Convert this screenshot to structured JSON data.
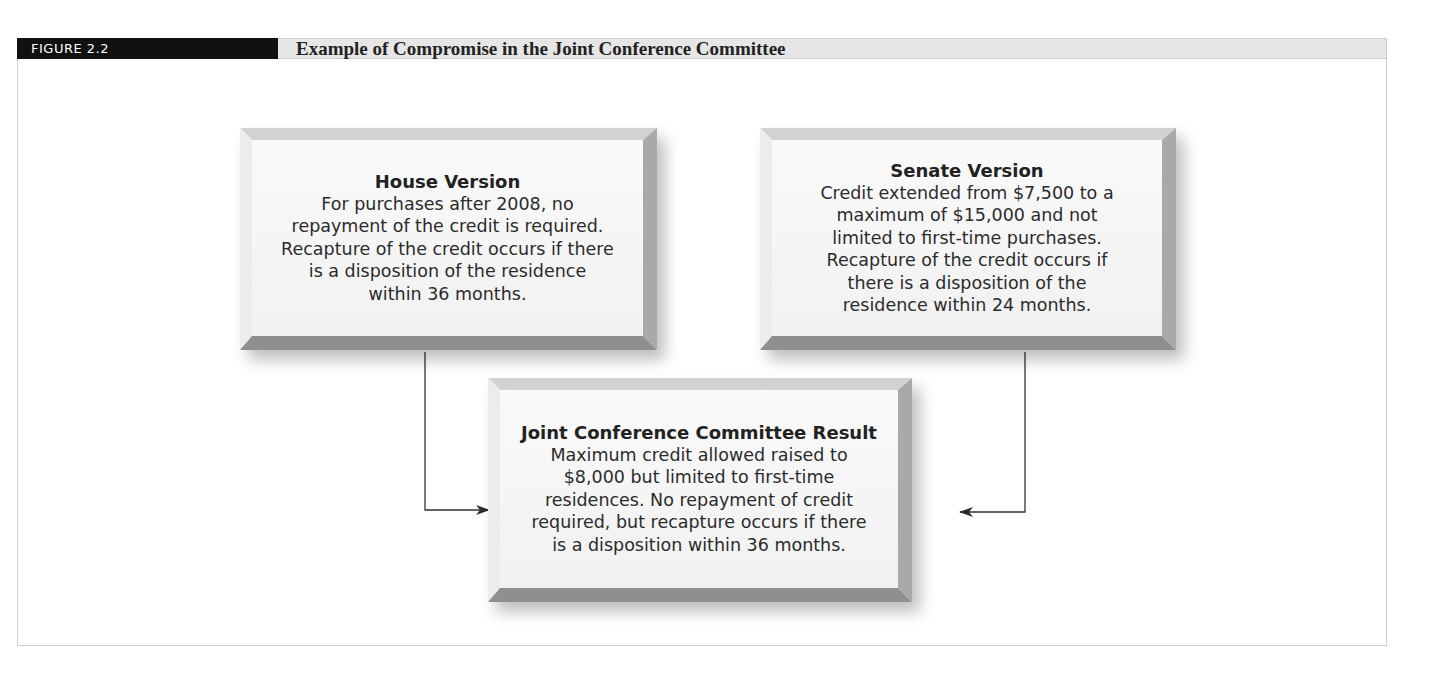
{
  "figure": {
    "label": "FIGURE 2.2",
    "title": "Example of Compromise in the Joint Conference Committee"
  },
  "boxes": {
    "house": {
      "title": "House Version",
      "lines": [
        "For purchases after 2008, no",
        "repayment of the credit is required.",
        "Recapture of the credit occurs if there",
        "is a disposition of the residence",
        "within 36 months."
      ]
    },
    "senate": {
      "title": "Senate Version",
      "lines": [
        "Credit extended from $7,500 to a",
        "maximum of $15,000 and not",
        "limited to first-time purchases.",
        "Recapture of the credit occurs if",
        "there is a disposition of the",
        "residence within 24 months."
      ]
    },
    "result": {
      "title": "Joint Conference Committee Result",
      "lines": [
        "Maximum credit allowed raised to",
        "$8,000 but limited to first-time",
        "residences. No repayment of credit",
        "required, but recapture occurs if there",
        "is a disposition within 36 months."
      ]
    }
  },
  "connectors": [
    {
      "from": "house",
      "to": "result",
      "direction": "right-arrow"
    },
    {
      "from": "senate",
      "to": "result",
      "direction": "left-arrow"
    }
  ],
  "colors": {
    "tab_bg": "#111111",
    "header_bg": "#e6e6e6",
    "box_face": "#f4f4f4",
    "line": "#333333"
  }
}
